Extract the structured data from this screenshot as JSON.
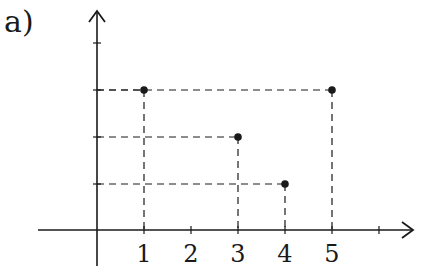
{
  "figure": {
    "label": "a)"
  },
  "colors": {
    "ink": "#1a1a1a",
    "background": "#ffffff"
  },
  "chart_data": {
    "type": "scatter",
    "title": "",
    "xlabel": "",
    "ylabel": "",
    "x_ticks": [
      1,
      2,
      3,
      4,
      5
    ],
    "x_tick_labels": [
      "1",
      "2",
      "3",
      "4",
      "5"
    ],
    "y_ticks": [
      1,
      2,
      3,
      4
    ],
    "y_tick_labels": [],
    "points": [
      {
        "x": 1,
        "y": 3
      },
      {
        "x": 5,
        "y": 3
      },
      {
        "x": 3,
        "y": 2
      },
      {
        "x": 4,
        "y": 1
      }
    ],
    "dashed_projections": true,
    "grid": false,
    "legend": null
  }
}
